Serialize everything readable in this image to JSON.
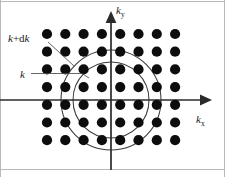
{
  "figure": {
    "background_color": "#ffffff",
    "width": 225,
    "height": 177
  },
  "axes": {
    "x_axis": {
      "label": "k",
      "subscript": "x",
      "name": "k-x-axis",
      "color": "#2b2b2b",
      "y": 100,
      "x_start": 0,
      "x_end": 206,
      "label_x": 196,
      "label_y": 122
    },
    "y_axis": {
      "label": "k",
      "subscript": "y",
      "name": "k-y-axis",
      "color": "#2b2b2b",
      "x": 111,
      "y_start": 170,
      "y_end": 14,
      "label_x": 117,
      "label_y": 13
    }
  },
  "rings": [
    {
      "id": "outer-ring",
      "label": "k+dk",
      "label_parts": {
        "k": "k",
        "plus": "+",
        "d": "d",
        "k2": "k"
      },
      "radius": 50,
      "cx": 111,
      "cy": 100,
      "stroke": "#3a3a3a",
      "label_x": 10,
      "label_y": 40,
      "leader": {
        "x1": 50,
        "y1": 43,
        "x2": 72,
        "y2": 64
      }
    },
    {
      "id": "inner-ring",
      "label": "k",
      "radius": 38,
      "cx": 111,
      "cy": 100,
      "stroke": "#3a3a3a",
      "label_x": 22,
      "label_y": 76,
      "leader": {
        "x1": 32,
        "y1": 73,
        "x2": 80,
        "y2": 73
      }
    }
  ],
  "lattice": {
    "name": "reciprocal-lattice-dot-grid",
    "dot_color": "#0d0d0d",
    "dot_radius": 5.1,
    "columns": 8,
    "rows": 7,
    "x_start": 47,
    "x_spacing": 18.3,
    "y_start": 34,
    "y_spacing": 17.7,
    "x_positions": [
      47,
      65.3,
      83.6,
      101.9,
      120.2,
      138.5,
      156.8,
      175.1
    ],
    "y_positions": [
      34,
      51.7,
      69.4,
      87.1,
      104.8,
      122.5,
      140.2
    ]
  },
  "frame": {
    "name": "figure-border",
    "color": "#b9b9b9",
    "top_y": 1,
    "bottom_y": 170,
    "left_x": 1,
    "right_x": 224
  }
}
